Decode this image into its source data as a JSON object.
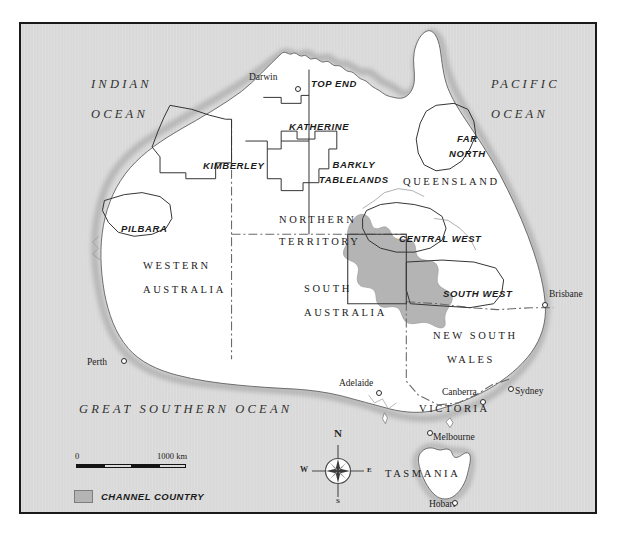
{
  "figure": {
    "kind": "reference-map"
  },
  "colors": {
    "ocean": "#d9d9d9",
    "land": "#ffffff",
    "channel_country": "#b4b4b4",
    "border_frame": "#1a1a1a",
    "coastline": "#6f6f6f",
    "state_border": "#4a4a4a",
    "region_border": "#2a2a2a",
    "text": "#1b1b1b"
  },
  "ocean_labels": [
    {
      "id": "indian-ocean",
      "line1": "INDIAN",
      "line2": "OCEAN",
      "x": 70,
      "y": 52
    },
    {
      "id": "pacific-ocean",
      "line1": "PACIFIC",
      "line2": "OCEAN",
      "x": 472,
      "y": 52
    },
    {
      "id": "great-southern-ocean",
      "line1": "GREAT SOUTHERN OCEAN",
      "line2": "",
      "x": 62,
      "y": 378
    }
  ],
  "state_labels": [
    {
      "id": "western-australia",
      "line1": "WESTERN",
      "line2": "AUSTRALIA",
      "x": 125,
      "y": 236
    },
    {
      "id": "northern-territory",
      "line1": "NORTHERN",
      "line2": "TERRITORY",
      "x": 261,
      "y": 192
    },
    {
      "id": "south-australia",
      "line1": "SOUTH",
      "line2": "AUSTRALIA",
      "x": 285,
      "y": 258
    },
    {
      "id": "queensland",
      "line1": "QUEENSLAND",
      "line2": "",
      "x": 385,
      "y": 155
    },
    {
      "id": "new-south-wales",
      "line1": "NEW SOUTH",
      "line2": "WALES",
      "x": 417,
      "y": 305
    },
    {
      "id": "victoria",
      "line1": "VICTORIA",
      "line2": "",
      "x": 400,
      "y": 382
    },
    {
      "id": "tasmania",
      "line1": "TASMANIA",
      "line2": "",
      "x": 368,
      "y": 448
    }
  ],
  "region_labels": [
    {
      "id": "top-end",
      "line1": "TOP END",
      "line2": "",
      "x": 292,
      "y": 58
    },
    {
      "id": "katherine",
      "line1": "KATHERINE",
      "line2": "",
      "x": 272,
      "y": 101
    },
    {
      "id": "kimberley",
      "line1": "KIMBERLEY",
      "line2": "",
      "x": 186,
      "y": 140
    },
    {
      "id": "barkly-tablelands",
      "line1": "BARKLY",
      "line2": "TABLELANDS",
      "x": 302,
      "y": 140
    },
    {
      "id": "pilbara",
      "line1": "PILBARA",
      "line2": "",
      "x": 105,
      "y": 203
    },
    {
      "id": "far-north",
      "line1": "FAR",
      "line2": "NORTH",
      "x": 432,
      "y": 111
    },
    {
      "id": "central-west",
      "line1": "CENTRAL WEST",
      "line2": "",
      "x": 382,
      "y": 213
    },
    {
      "id": "south-west",
      "line1": "SOUTH WEST",
      "line2": "",
      "x": 425,
      "y": 268
    }
  ],
  "cities": [
    {
      "id": "darwin",
      "name": "Darwin",
      "label_x": 245,
      "label_y": 55,
      "dot_x": 276,
      "dot_y": 66,
      "anchor": "right"
    },
    {
      "id": "brisbane",
      "name": "Brisbane",
      "label_x": 546,
      "label_y": 272,
      "dot_x": 540,
      "dot_y": 286,
      "anchor": "left"
    },
    {
      "id": "sydney",
      "name": "Sydney",
      "label_x": 512,
      "label_y": 368,
      "dot_x": 506,
      "dot_y": 369,
      "anchor": "left"
    },
    {
      "id": "canberra",
      "name": "Canberra",
      "label_x": 441,
      "label_y": 370,
      "dot_x": 478,
      "dot_y": 382,
      "anchor": "right"
    },
    {
      "id": "melbourne",
      "name": "Melbourne",
      "label_x": 431,
      "label_y": 416,
      "dot_x": 427,
      "dot_y": 415,
      "anchor": "left"
    },
    {
      "id": "hobart",
      "name": "Hobart",
      "label_x": 426,
      "label_y": 483,
      "dot_x": 450,
      "dot_y": 483,
      "anchor": "right"
    },
    {
      "id": "adelaide",
      "name": "Adelaide",
      "label_x": 337,
      "label_y": 361,
      "dot_x": 373,
      "dot_y": 373,
      "anchor": "right"
    },
    {
      "id": "perth",
      "name": "Perth",
      "label_x": 85,
      "label_y": 340,
      "dot_x": 119,
      "dot_y": 342,
      "anchor": "right"
    }
  ],
  "scale_bar": {
    "start_label": "0",
    "end_label": "1000 km",
    "segments": 4,
    "x": 74,
    "y": 441,
    "width": 110
  },
  "legend": {
    "items": [
      {
        "id": "channel-country",
        "label": "CHANNEL COUNTRY",
        "swatch_color": "#b4b4b4"
      }
    ],
    "x": 72,
    "y": 470
  },
  "compass": {
    "north": "N",
    "east": "E",
    "south": "S",
    "west": "W",
    "center_x": 317,
    "center_y": 449,
    "radius": 13
  }
}
